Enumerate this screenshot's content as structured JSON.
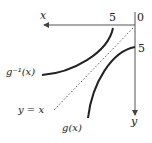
{
  "diagram": {
    "orientation": "rotated 180 degrees",
    "origin_label": "0",
    "x_axis_label": "x",
    "y_axis_label": "y",
    "x_tick_label": "5",
    "y_tick_label": "5",
    "curve_g_label": "g(x)",
    "curve_g_inverse_label": "g⁻¹(x)",
    "reflection_line_label": "y = x",
    "colors": {
      "axes": "#555555",
      "curves": "#222222",
      "dashed": "#555555"
    }
  }
}
